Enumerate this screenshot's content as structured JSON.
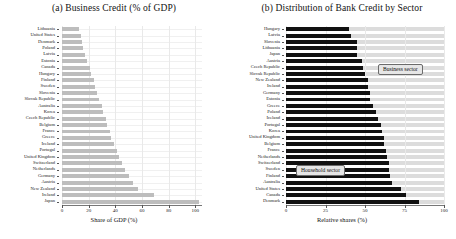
{
  "figure": {
    "width": 456,
    "height": 239,
    "bar_color_business_panel_a": "#bdbdbd",
    "bar_color_business_panel_b": "#111111",
    "band_color_household": "#dcdcdc"
  },
  "panel_a": {
    "title": "(a) Business Credit (% of GDP)",
    "xlabel": "Share of GDP (%)",
    "xticks": [
      "0",
      "20",
      "40",
      "60",
      "80",
      "100"
    ]
  },
  "panel_b": {
    "title": "(b) Distribution of Bank Credit by Sector",
    "xlabel": "Relative shares (%)",
    "xticks": [
      "0",
      "25",
      "50",
      "75",
      "100"
    ],
    "legend": {
      "business": "Business sector",
      "household": "Household sector"
    }
  },
  "chart_data": [
    {
      "id": "panel_a",
      "type": "bar",
      "orientation": "horizontal",
      "title": "(a) Business Credit (% of GDP)",
      "xlabel": "Share of GDP (%)",
      "ylabel": "",
      "xlim": [
        0,
        105
      ],
      "xticks": [
        0,
        20,
        40,
        60,
        80,
        100
      ],
      "grid": true,
      "legend": "none",
      "categories": [
        "Lithuania",
        "United States",
        "Denmark",
        "Poland",
        "Latvia",
        "Estonia",
        "Canada",
        "Hungary",
        "Finland",
        "Sweden",
        "Slovenia",
        "Slovak Republic",
        "Australia",
        "Korea",
        "Czech Republic",
        "Belgium",
        "France",
        "Greece",
        "Iceland",
        "Portugal",
        "United Kingdom",
        "Switzerland",
        "Netherlands",
        "Germany",
        "Austria",
        "New Zealand",
        "Ireland",
        "Japan"
      ],
      "values": [
        13,
        14,
        15,
        16,
        17,
        19,
        21,
        22,
        24,
        25,
        26,
        28,
        30,
        31,
        33,
        34,
        36,
        37,
        39,
        41,
        43,
        45,
        47,
        50,
        53,
        57,
        69,
        103
      ]
    },
    {
      "id": "panel_b",
      "type": "bar",
      "orientation": "horizontal",
      "title": "(b) Distribution of Bank Credit by Sector",
      "xlabel": "Relative shares (%)",
      "ylabel": "",
      "xlim": [
        0,
        100
      ],
      "xticks": [
        0,
        25,
        50,
        75,
        100
      ],
      "grid": true,
      "legend_entries": [
        "Business sector",
        "Household sector"
      ],
      "legend_position": "inside",
      "note": "Dark bar = business sector share; light grey remainder = household sector share (sums to 100%).",
      "categories": [
        "Hungary",
        "Latvia",
        "Slovenia",
        "Lithuania",
        "Japan",
        "Austria",
        "Czech Republic",
        "Slovak Republic",
        "New Zealand",
        "Ireland",
        "Germany",
        "Estonia",
        "Greece",
        "Poland",
        "Iceland",
        "Portugal",
        "Korea",
        "United Kingdom",
        "Belgium",
        "France",
        "Netherlands",
        "Switzerland",
        "Sweden",
        "Finland",
        "Australia",
        "United States",
        "Canada",
        "Denmark"
      ],
      "series": [
        {
          "name": "Business sector",
          "values": [
            40,
            41,
            45,
            45,
            45,
            48,
            49,
            50,
            52,
            52,
            53,
            53,
            55,
            57,
            58,
            60,
            61,
            62,
            62,
            63,
            64,
            65,
            65,
            66,
            67,
            73,
            76,
            84
          ]
        },
        {
          "name": "Household sector",
          "values": [
            60,
            59,
            55,
            55,
            55,
            52,
            51,
            50,
            48,
            48,
            47,
            47,
            45,
            43,
            42,
            40,
            39,
            38,
            38,
            37,
            36,
            35,
            35,
            34,
            33,
            27,
            24,
            16
          ]
        }
      ]
    }
  ]
}
